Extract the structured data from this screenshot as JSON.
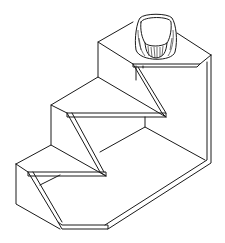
{
  "figure": {
    "description": "Isometric line drawing of a three-step stair-shaped solid with chamfered bottom and a cylindrical knob on the top step",
    "stroke_color": "#1a1a1a",
    "background_color": "#ffffff",
    "parts": [
      {
        "name": "top-step",
        "label": "Top step"
      },
      {
        "name": "middle-step",
        "label": "Middle step"
      },
      {
        "name": "bottom-step",
        "label": "Bottom step"
      },
      {
        "name": "knob",
        "label": "Cylindrical knob"
      },
      {
        "name": "base-floor",
        "label": "Base floor"
      },
      {
        "name": "right-wall",
        "label": "Right wall"
      }
    ]
  }
}
